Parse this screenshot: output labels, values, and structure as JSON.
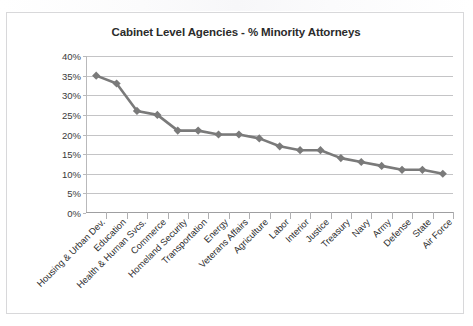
{
  "chart_data": {
    "type": "line",
    "title": "Cabinet Level Agencies - % Minority Attorneys",
    "xlabel": "",
    "ylabel": "",
    "ylim": [
      0,
      40
    ],
    "ytick_labels": [
      "40%",
      "35%",
      "30%",
      "25%",
      "20%",
      "15%",
      "10%",
      "5%",
      "0%"
    ],
    "ytick_values": [
      40,
      35,
      30,
      25,
      20,
      15,
      10,
      5,
      0
    ],
    "grid": true,
    "legend": "none",
    "series_color": "#7a7a7a",
    "marker": "diamond",
    "categories": [
      "Housing & Urban Dev.",
      "Education",
      "Health & Human Svcs.",
      "Commerce",
      "Homeland Security",
      "Transportation",
      "Energy",
      "Veterans Affairs",
      "Agriculture",
      "Labor",
      "Interior",
      "Justice",
      "Treasury",
      "Navy",
      "Army",
      "Defense",
      "State",
      "Air Force"
    ],
    "values": [
      35,
      33,
      26,
      25,
      21,
      21,
      20,
      20,
      19,
      17,
      16,
      16,
      14,
      13,
      12,
      11,
      11,
      10
    ]
  }
}
